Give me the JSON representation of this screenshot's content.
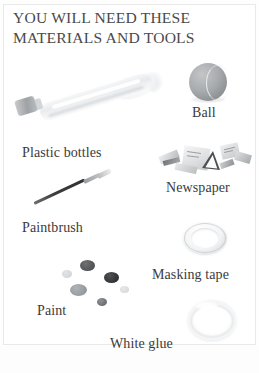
{
  "page": {
    "title_line1": "YOU WILL NEED THESE",
    "title_line2": "MATERIALS AND TOOLS",
    "background_color": "#ffffff",
    "text_color": "#3b3b3b",
    "frame_color": "#e9e9e9"
  },
  "items": [
    {
      "id": "plastic-bottles",
      "label": "Plastic bottles",
      "icon": "plastic-bottle-illustration"
    },
    {
      "id": "ball",
      "label": "Ball",
      "icon": "ball-illustration"
    },
    {
      "id": "paintbrush",
      "label": "Paintbrush",
      "icon": "paintbrush-illustration"
    },
    {
      "id": "newspaper",
      "label": "Newspaper",
      "icon": "newspaper-scraps-illustration"
    },
    {
      "id": "masking-tape",
      "label": "Masking tape",
      "icon": "masking-tape-roll-illustration"
    },
    {
      "id": "paint",
      "label": "Paint",
      "icon": "paint-blobs-illustration"
    },
    {
      "id": "white-glue",
      "label": "White glue",
      "icon": "white-glue-ring-illustration"
    }
  ]
}
